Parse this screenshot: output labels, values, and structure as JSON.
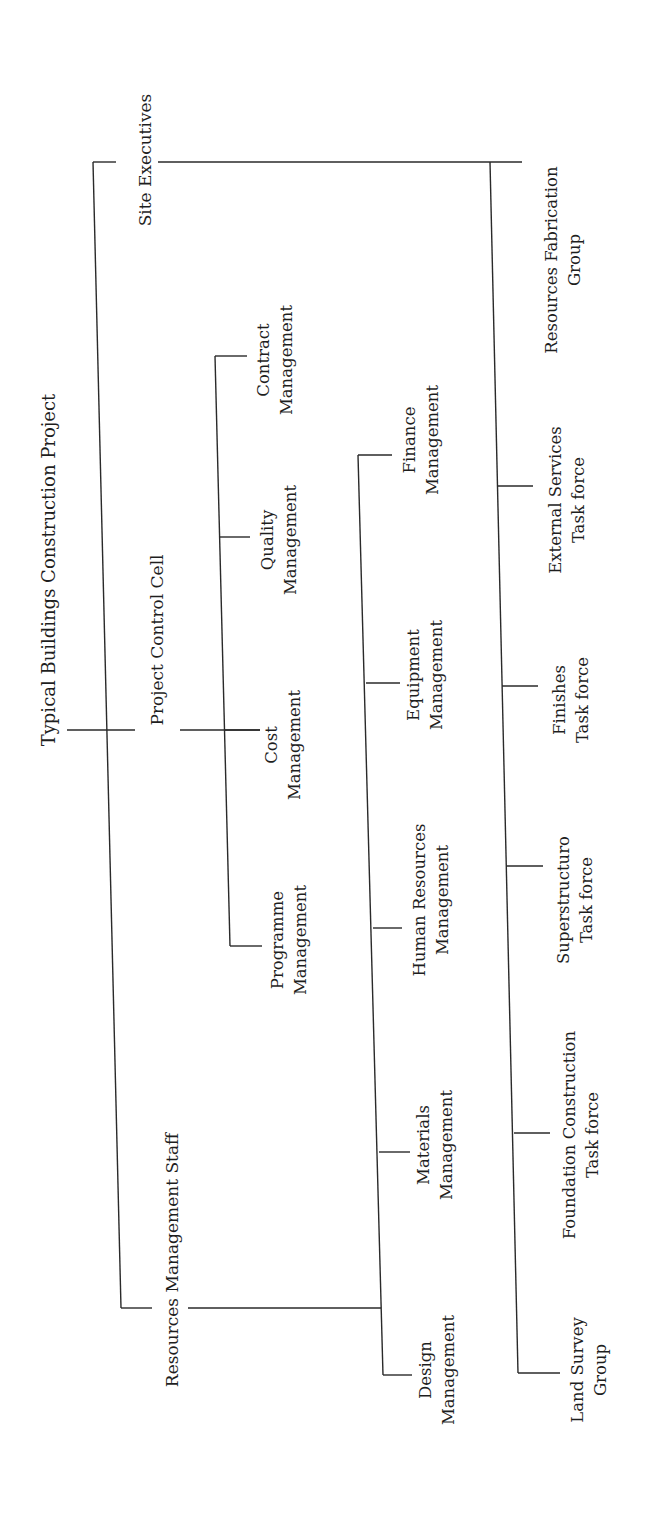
{
  "title": "Typical Buildings Construction Project",
  "root": {
    "label": "Typical Buildings Construction Project"
  },
  "branches": {
    "site_executives": {
      "label": "Site Executives",
      "children": [
        {
          "line1": "Resources Fabrication",
          "line2": "Group"
        },
        {
          "line1": "External Services",
          "line2": "Task force"
        },
        {
          "line1": "Finishes",
          "line2": "Task force"
        },
        {
          "line1": "Superstructuro",
          "line2": "Task force"
        },
        {
          "line1": "Foundation Construction",
          "line2": "Task force"
        },
        {
          "line1": "Land Survey",
          "line2": "Group"
        }
      ]
    },
    "project_control_cell": {
      "label": "Project Control Cell",
      "children": [
        {
          "line1": "Contract",
          "line2": "Management"
        },
        {
          "line1": "Quality",
          "line2": "Management"
        },
        {
          "line1": "Cost",
          "line2": "Management"
        },
        {
          "line1": "Programme",
          "line2": "Management"
        }
      ]
    },
    "resources_management_staff": {
      "label": "Resources Management Staff",
      "children": [
        {
          "line1": "Finance",
          "line2": "Management"
        },
        {
          "line1": "Equipment",
          "line2": "Management"
        },
        {
          "line1": "Human Resources",
          "line2": "Management"
        },
        {
          "line1": "Materials",
          "line2": "Management"
        },
        {
          "line1": "Design",
          "line2": "Management"
        }
      ]
    }
  },
  "style": {
    "line_color": "#2a2a2a",
    "text_color": "#1e1e1e",
    "background": "#ffffff",
    "orientation": "rotated -90deg"
  }
}
